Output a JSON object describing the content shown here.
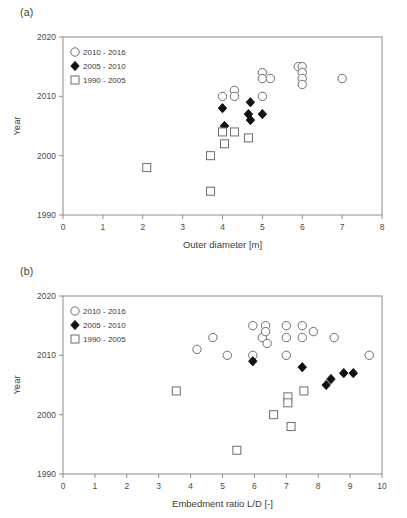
{
  "figure": {
    "panels": [
      {
        "key": "a",
        "label": "(a)",
        "chart_data": {
          "type": "scatter",
          "title": "",
          "xlabel": "Outer diameter [m]",
          "ylabel": "Year",
          "xlim": [
            0,
            8
          ],
          "ylim": [
            1990,
            2020
          ],
          "xticks": [
            "0",
            "1",
            "2",
            "3",
            "4",
            "5",
            "6",
            "7",
            "8"
          ],
          "yticks": [
            "1990",
            "2000",
            "2010",
            "2020"
          ],
          "grid": false,
          "legend_position": "top-left",
          "series": [
            {
              "name": "2010 - 2016",
              "marker": "open-circle",
              "color": "#6e6e6e",
              "points": [
                [
                  4.0,
                  2010
                ],
                [
                  4.3,
                  2011
                ],
                [
                  4.3,
                  2010
                ],
                [
                  5.0,
                  2010
                ],
                [
                  5.0,
                  2014
                ],
                [
                  5.0,
                  2013
                ],
                [
                  5.2,
                  2013
                ],
                [
                  5.9,
                  2015
                ],
                [
                  6.0,
                  2015
                ],
                [
                  6.0,
                  2014
                ],
                [
                  6.0,
                  2013
                ],
                [
                  6.0,
                  2012
                ],
                [
                  7.0,
                  2013
                ]
              ]
            },
            {
              "name": "2005 - 2010",
              "marker": "filled-diamond",
              "color": "#111111",
              "points": [
                [
                  4.0,
                  2008
                ],
                [
                  4.05,
                  2005
                ],
                [
                  4.7,
                  2009
                ],
                [
                  4.65,
                  2007
                ],
                [
                  4.7,
                  2006
                ],
                [
                  5.0,
                  2007
                ]
              ]
            },
            {
              "name": "1990 - 2005",
              "marker": "open-square",
              "color": "#6e6e6e",
              "points": [
                [
                  2.1,
                  1998
                ],
                [
                  3.7,
                  2000
                ],
                [
                  3.7,
                  1994
                ],
                [
                  4.0,
                  2004
                ],
                [
                  4.05,
                  2002
                ],
                [
                  4.3,
                  2004
                ],
                [
                  4.65,
                  2003
                ]
              ]
            }
          ]
        }
      },
      {
        "key": "b",
        "label": "(b)",
        "chart_data": {
          "type": "scatter",
          "title": "",
          "xlabel": "Embedment ratio L/D [-]",
          "ylabel": "Year",
          "xlim": [
            0,
            10
          ],
          "ylim": [
            1990,
            2020
          ],
          "xticks": [
            "0",
            "1",
            "2",
            "3",
            "4",
            "5",
            "6",
            "7",
            "8",
            "9",
            "10"
          ],
          "yticks": [
            "1990",
            "2000",
            "2010",
            "2020"
          ],
          "grid": false,
          "legend_position": "top-left",
          "series": [
            {
              "name": "2010 - 2016",
              "marker": "open-circle",
              "color": "#6e6e6e",
              "points": [
                [
                  4.2,
                  2011
                ],
                [
                  4.7,
                  2013
                ],
                [
                  5.15,
                  2010
                ],
                [
                  5.95,
                  2015
                ],
                [
                  5.95,
                  2010
                ],
                [
                  6.25,
                  2013
                ],
                [
                  6.35,
                  2015
                ],
                [
                  6.35,
                  2014
                ],
                [
                  6.4,
                  2012
                ],
                [
                  7.0,
                  2015
                ],
                [
                  7.0,
                  2013
                ],
                [
                  7.0,
                  2010
                ],
                [
                  7.5,
                  2015
                ],
                [
                  7.5,
                  2013
                ],
                [
                  7.85,
                  2014
                ],
                [
                  8.5,
                  2013
                ],
                [
                  9.6,
                  2010
                ]
              ]
            },
            {
              "name": "2005 - 2010",
              "marker": "filled-diamond",
              "color": "#111111",
              "points": [
                [
                  5.95,
                  2009
                ],
                [
                  7.5,
                  2008
                ],
                [
                  8.25,
                  2005
                ],
                [
                  8.4,
                  2006
                ],
                [
                  8.8,
                  2007
                ],
                [
                  9.1,
                  2007
                ]
              ]
            },
            {
              "name": "1990 - 2005",
              "marker": "open-square",
              "color": "#6e6e6e",
              "points": [
                [
                  3.55,
                  2004
                ],
                [
                  5.45,
                  1994
                ],
                [
                  6.6,
                  2000
                ],
                [
                  7.05,
                  2003
                ],
                [
                  7.05,
                  2002
                ],
                [
                  7.15,
                  1998
                ],
                [
                  7.55,
                  2004
                ]
              ]
            }
          ]
        }
      }
    ]
  }
}
